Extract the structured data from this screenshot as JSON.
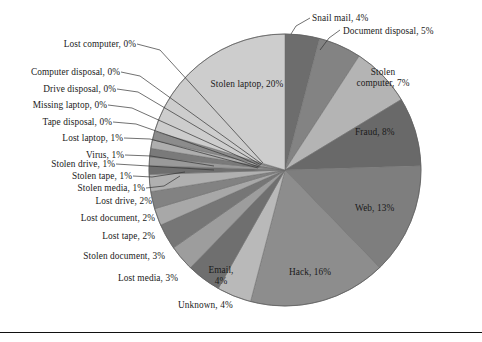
{
  "figure": {
    "type": "pie-chart",
    "has_bottom_rule": true,
    "background": "#ffffff"
  },
  "chart_data": {
    "type": "pie",
    "title": "",
    "subtitle": "",
    "xlabel": "",
    "ylabel": "",
    "legend_position": "none",
    "labels_style": "category, percent",
    "start_angle_deg": 0,
    "direction": "clockwise",
    "total_percent": 100,
    "categories": [
      "Snail mail",
      "Document disposal",
      "Stolen computer",
      "Fraud",
      "Web",
      "Hack",
      "Unknown",
      "Email",
      "Lost media",
      "Stolen document",
      "Lost tape",
      "Lost document",
      "Lost drive",
      "Stolen media",
      "Stolen tape",
      "Stolen drive",
      "Virus",
      "Lost laptop",
      "Tape disposal",
      "Missing laptop",
      "Drive disposal",
      "Computer disposal",
      "Lost computer",
      "Stolen laptop"
    ],
    "values": [
      4,
      5,
      7,
      8,
      13,
      16,
      4,
      4,
      3,
      3,
      2,
      2,
      2,
      1,
      1,
      1,
      1,
      1,
      0,
      0,
      0,
      0,
      0,
      20
    ],
    "colors": [
      "#6d6d6d",
      "#838383",
      "#b4b4b4",
      "#696969",
      "#7e7e7e",
      "#8d8d8d",
      "#b9b9b9",
      "#6f6f6f",
      "#9d9d9d",
      "#767676",
      "#a8a8a8",
      "#828282",
      "#b0b0b0",
      "#6e6e6e",
      "#9a9a9a",
      "#7a7a7a",
      "#aeaeae",
      "#8c8c8c",
      "#b6b6b6",
      "#9f9f9f",
      "#888888",
      "#787878",
      "#a4a4a4",
      "#cdcdcd"
    ],
    "slices": [
      {
        "label": "Snail mail, 4%",
        "name": "Snail mail",
        "value": 4
      },
      {
        "label": "Document disposal, 5%",
        "name": "Document disposal",
        "value": 5
      },
      {
        "label": "Stolen computer, 7%",
        "name": "Stolen computer",
        "value": 7
      },
      {
        "label": "Fraud, 8%",
        "name": "Fraud",
        "value": 8
      },
      {
        "label": "Web, 13%",
        "name": "Web",
        "value": 13
      },
      {
        "label": "Hack, 16%",
        "name": "Hack",
        "value": 16
      },
      {
        "label": "Unknown, 4%",
        "name": "Unknown",
        "value": 4
      },
      {
        "label": "Email, 4%",
        "name": "Email",
        "value": 4
      },
      {
        "label": "Lost media, 3%",
        "name": "Lost media",
        "value": 3
      },
      {
        "label": "Stolen document, 3%",
        "name": "Stolen document",
        "value": 3
      },
      {
        "label": "Lost tape, 2%",
        "name": "Lost tape",
        "value": 2
      },
      {
        "label": "Lost document, 2%",
        "name": "Lost document",
        "value": 2
      },
      {
        "label": "Lost drive, 2%",
        "name": "Lost drive",
        "value": 2
      },
      {
        "label": "Stolen media, 1%",
        "name": "Stolen media",
        "value": 1
      },
      {
        "label": "Stolen tape, 1%",
        "name": "Stolen tape",
        "value": 1
      },
      {
        "label": "Stolen drive, 1%",
        "name": "Stolen drive",
        "value": 1
      },
      {
        "label": "Virus, 1%",
        "name": "Virus",
        "value": 1
      },
      {
        "label": "Lost laptop, 1%",
        "name": "Lost laptop",
        "value": 1
      },
      {
        "label": "Tape disposal, 0%",
        "name": "Tape disposal",
        "value": 0
      },
      {
        "label": "Missing laptop, 0%",
        "name": "Missing laptop",
        "value": 0
      },
      {
        "label": "Drive disposal, 0%",
        "name": "Drive disposal",
        "value": 0
      },
      {
        "label": "Computer disposal, 0%",
        "name": "Computer disposal",
        "value": 0
      },
      {
        "label": "Lost computer, 0%",
        "name": "Lost computer",
        "value": 0
      },
      {
        "label": "Stolen laptop, 20%",
        "name": "Stolen laptop",
        "value": 20
      }
    ]
  },
  "labels": {
    "snail_mail": "Snail mail, 4%",
    "document_disposal": "Document disposal, 5%",
    "stolen_computer_l1": "Stolen",
    "stolen_computer_l2": "computer, 7%",
    "fraud": "Fraud, 8%",
    "web": "Web, 13%",
    "hack": "Hack, 16%",
    "unknown": "Unknown, 4%",
    "email_l1": "Email,",
    "email_l2": "4%",
    "lost_media": "Lost media, 3%",
    "stolen_document": "Stolen document, 3%",
    "lost_tape": "Lost tape, 2%",
    "lost_document": "Lost document, 2%",
    "lost_drive": "Lost drive, 2%",
    "stolen_media": "Stolen media, 1%",
    "stolen_tape": "Stolen tape, 1%",
    "stolen_drive": "Stolen drive, 1%",
    "virus": "Virus, 1%",
    "lost_laptop": "Lost laptop, 1%",
    "tape_disposal": "Tape disposal, 0%",
    "missing_laptop": "Missing laptop, 0%",
    "drive_disposal": "Drive disposal, 0%",
    "computer_disposal": "Computer disposal, 0%",
    "lost_computer": "Lost computer, 0%",
    "stolen_laptop": "Stolen laptop, 20%"
  }
}
